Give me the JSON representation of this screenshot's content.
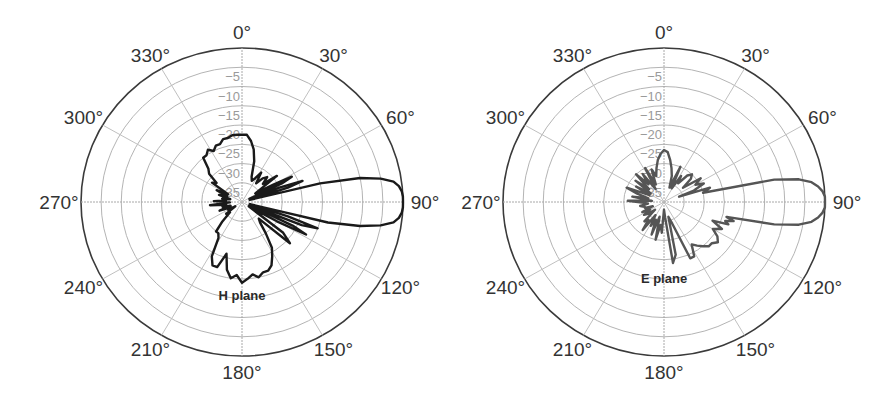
{
  "chart_data": [
    {
      "type": "polar",
      "title": "H plane",
      "center": [
        242,
        202
      ],
      "radius_x": 161,
      "radius_y": 154,
      "r_range_db": [
        -40,
        0
      ],
      "ring_labels": [
        "-5",
        "-10",
        "-15",
        "-20",
        "-25",
        "-30",
        "-35"
      ],
      "ring_values": [
        0,
        -5,
        -10,
        -15,
        -20,
        -25,
        -30,
        -35
      ],
      "angle_ticks": [
        0,
        30,
        60,
        90,
        120,
        150,
        180,
        210,
        240,
        270,
        300,
        330
      ],
      "angle_labels": [
        "0°",
        "30°",
        "60°",
        "90°",
        "120°",
        "150°",
        "180°",
        "210°",
        "240°",
        "270°",
        "300°",
        "330°"
      ],
      "grid": true,
      "line_color": "#1a1a1a",
      "label": {
        "text": "H plane",
        "x": 242,
        "y": 300
      },
      "series": [
        {
          "name": "H plane pattern (dB)",
          "theta_deg": [
            0,
            4,
            8,
            12,
            16,
            20,
            24,
            28,
            32,
            36,
            40,
            44,
            48,
            52,
            56,
            60,
            62,
            64,
            66,
            68,
            70,
            72,
            74,
            76,
            78,
            80,
            82,
            84,
            86,
            88,
            90,
            92,
            94,
            96,
            98,
            100,
            102,
            104,
            106,
            108,
            110,
            112,
            114,
            116,
            118,
            120,
            124,
            128,
            132,
            136,
            140,
            144,
            148,
            152,
            156,
            160,
            164,
            168,
            172,
            176,
            180,
            184,
            188,
            192,
            196,
            200,
            204,
            208,
            212,
            216,
            220,
            224,
            228,
            232,
            236,
            240,
            244,
            248,
            252,
            256,
            260,
            264,
            268,
            272,
            276,
            280,
            284,
            288,
            292,
            296,
            300,
            304,
            308,
            312,
            316,
            320,
            324,
            328,
            332,
            336,
            340,
            344,
            348,
            352,
            356
          ],
          "values_db": [
            -22.5,
            -22.5,
            -24,
            -26,
            -29,
            -33,
            -34,
            -33,
            -31,
            -34,
            -32,
            -31,
            -33,
            -29,
            -36,
            -31,
            -26,
            -29,
            -38,
            -30,
            -24,
            -28,
            -38,
            -20,
            -10,
            -5,
            -2,
            -0.8,
            -0.2,
            0,
            0,
            0,
            -0.2,
            -0.8,
            -2,
            -5,
            -10,
            -18,
            -38,
            -28,
            -20,
            -24,
            -38,
            -26,
            -22,
            -30,
            -38,
            -27,
            -24,
            -34,
            -33,
            -30,
            -26,
            -24,
            -22,
            -21,
            -21,
            -20,
            -21,
            -20,
            -19,
            -21,
            -20,
            -22,
            -26,
            -22,
            -22,
            -24,
            -29,
            -30,
            -30,
            -33,
            -36,
            -35,
            -38,
            -36,
            -37,
            -34,
            -37,
            -35,
            -36,
            -32,
            -37,
            -33,
            -36,
            -35,
            -37,
            -34,
            -36,
            -33,
            -36,
            -31,
            -32,
            -29,
            -28,
            -25,
            -25,
            -24,
            -25,
            -24,
            -24,
            -23,
            -23,
            -22.5,
            -22.5
          ]
        }
      ]
    },
    {
      "type": "polar",
      "title": "E plane",
      "center": [
        664,
        202
      ],
      "radius_x": 161,
      "radius_y": 154,
      "r_range_db": [
        -40,
        0
      ],
      "ring_labels": [
        "-5",
        "-10",
        "-15",
        "-20",
        "-25",
        "-30",
        "-35"
      ],
      "ring_values": [
        0,
        -5,
        -10,
        -15,
        -20,
        -25,
        -30,
        -35
      ],
      "angle_ticks": [
        0,
        30,
        60,
        90,
        120,
        150,
        180,
        210,
        240,
        270,
        300,
        330
      ],
      "angle_labels": [
        "0°",
        "30°",
        "60°",
        "90°",
        "120°",
        "150°",
        "180°",
        "210°",
        "240°",
        "270°",
        "300°",
        "330°"
      ],
      "grid": true,
      "line_color": "#555555",
      "label": {
        "text": "E plane",
        "x": 664,
        "y": 283
      },
      "series": [
        {
          "name": "E plane pattern (dB)",
          "theta_deg": [
            0,
            4,
            8,
            12,
            16,
            20,
            24,
            28,
            32,
            36,
            40,
            44,
            48,
            52,
            56,
            60,
            64,
            68,
            70,
            72,
            74,
            76,
            78,
            80,
            82,
            84,
            86,
            88,
            90,
            92,
            94,
            96,
            98,
            100,
            102,
            104,
            106,
            108,
            110,
            112,
            116,
            120,
            124,
            128,
            132,
            136,
            140,
            144,
            148,
            152,
            156,
            160,
            164,
            168,
            172,
            176,
            180,
            184,
            188,
            192,
            196,
            200,
            204,
            208,
            212,
            216,
            220,
            224,
            228,
            232,
            236,
            240,
            244,
            248,
            252,
            256,
            260,
            264,
            268,
            272,
            276,
            280,
            284,
            288,
            292,
            296,
            300,
            304,
            308,
            312,
            316,
            320,
            324,
            328,
            332,
            336,
            340,
            344,
            348,
            352,
            356
          ],
          "values_db": [
            -26.5,
            -27,
            -29,
            -31,
            -33,
            -36,
            -30,
            -36,
            -32,
            -34,
            -31,
            -30,
            -31,
            -34,
            -29,
            -31,
            -29,
            -32,
            -36,
            -28,
            -29,
            -30,
            -12,
            -6,
            -3,
            -1.5,
            -0.5,
            0,
            0,
            0,
            -0.5,
            -1.5,
            -3,
            -6,
            -12,
            -24,
            -22,
            -24,
            -23,
            -27,
            -24,
            -26,
            -24,
            -23,
            -24,
            -24,
            -25,
            -26,
            -27,
            -24,
            -24,
            -34,
            -36,
            -26,
            -24,
            -36,
            -38,
            -32,
            -34,
            -30,
            -36,
            -31,
            -35,
            -33,
            -36,
            -31,
            -34,
            -33,
            -37,
            -35,
            -34,
            -36,
            -34,
            -37,
            -35,
            -35,
            -34,
            -36,
            -35,
            -31,
            -37,
            -32,
            -36,
            -33,
            -30,
            -36,
            -32,
            -36,
            -31,
            -35,
            -30,
            -34,
            -31,
            -36,
            -30,
            -35,
            -31,
            -33,
            -31,
            -29,
            -27.5
          ]
        }
      ]
    }
  ]
}
